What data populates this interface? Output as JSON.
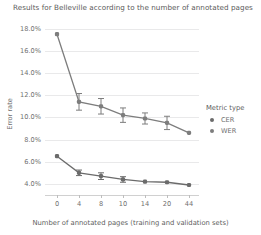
{
  "chart_data": {
    "type": "line",
    "title": "Results for Belleville according to the number of annotated pages",
    "xlabel": "Number of annotated pages (training and validation sets)",
    "ylabel": "Error rate",
    "categories": [
      "0",
      "4",
      "8",
      "10",
      "14",
      "20",
      "44"
    ],
    "ylim": [
      3.0,
      18.6
    ],
    "yticks": [
      "4.0%",
      "6.0%",
      "8.0%",
      "10.0%",
      "12.0%",
      "14.0%",
      "16.0%",
      "18.0%"
    ],
    "ytick_values": [
      4.0,
      6.0,
      8.0,
      10.0,
      12.0,
      14.0,
      16.0,
      18.0
    ],
    "grid": true,
    "legend_title": "Metric type",
    "legend_position": "right",
    "series": [
      {
        "name": "WER",
        "color": "#7d7d7d",
        "marker": "circle-square",
        "values": [
          17.5,
          11.4,
          11.0,
          10.2,
          9.9,
          9.5,
          8.6
        ],
        "errors": [
          0.0,
          0.75,
          0.7,
          0.65,
          0.5,
          0.6,
          0.0
        ]
      },
      {
        "name": "CER",
        "color": "#6b6b6b",
        "marker": "circle-square",
        "values": [
          6.5,
          5.0,
          4.7,
          4.4,
          4.2,
          4.15,
          3.9
        ],
        "errors": [
          0.0,
          0.25,
          0.3,
          0.25,
          0.0,
          0.0,
          0.0
        ]
      }
    ]
  }
}
